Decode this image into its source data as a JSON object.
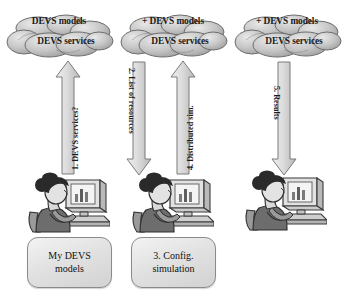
{
  "diagram": {
    "colors": {
      "cloud_fill": "#bdbdbd",
      "cloud_edge": "#6e6e6e",
      "arrow_fill": "#d6d6d6",
      "arrow_edge": "#7a7a7a",
      "box_fill": "#e6e6e6",
      "box_edge": "#8a8a8a",
      "text": "#1a1a1a",
      "background": "#ffffff"
    },
    "clouds": [
      {
        "id": "cloud-1",
        "line1": "DEVS models",
        "line2": "DEVS services"
      },
      {
        "id": "cloud-2",
        "line1": "+ DEVS models",
        "line2": "DEVS services"
      },
      {
        "id": "cloud-3",
        "line1": "+ DEVS models",
        "line2": "DEVS services"
      }
    ],
    "arrows": [
      {
        "id": "arrow-1",
        "label": "1. DEVS services?",
        "direction": "up"
      },
      {
        "id": "arrow-2",
        "label": "2. List of resources",
        "direction": "down"
      },
      {
        "id": "arrow-4",
        "label": "4. Distributed sim.",
        "direction": "up"
      },
      {
        "id": "arrow-5",
        "label": "5. Results",
        "direction": "down"
      }
    ],
    "workers": [
      {
        "id": "worker-1",
        "name": "user-at-computer"
      },
      {
        "id": "worker-2",
        "name": "user-at-computer"
      },
      {
        "id": "worker-3",
        "name": "user-at-computer"
      }
    ],
    "boxes": [
      {
        "id": "box-1",
        "line1": "My DEVS",
        "line2": "models"
      },
      {
        "id": "box-2",
        "line1": "3. Config.",
        "line2": "simulation"
      }
    ]
  }
}
